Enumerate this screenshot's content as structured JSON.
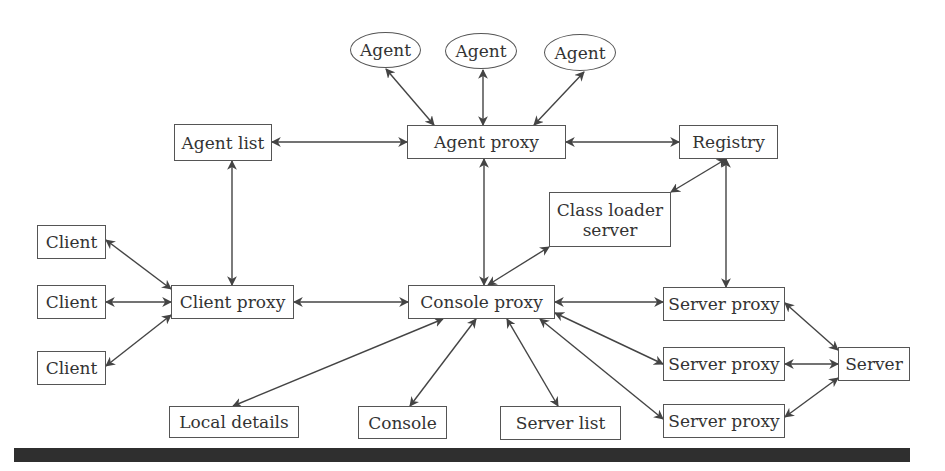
{
  "diagram": {
    "nodes": [
      {
        "id": "agent1",
        "label": "Agent",
        "shape": "ellipse",
        "x": 350,
        "y": 32,
        "w": 71,
        "h": 36
      },
      {
        "id": "agent2",
        "label": "Agent",
        "shape": "ellipse",
        "x": 445,
        "y": 33,
        "w": 72,
        "h": 36
      },
      {
        "id": "agent3",
        "label": "Agent",
        "shape": "ellipse",
        "x": 544,
        "y": 34,
        "w": 72,
        "h": 37
      },
      {
        "id": "agent-list",
        "label": "Agent list",
        "shape": "rect",
        "x": 174,
        "y": 124,
        "w": 98,
        "h": 37
      },
      {
        "id": "agent-proxy",
        "label": "Agent proxy",
        "shape": "rect",
        "x": 407,
        "y": 125,
        "w": 159,
        "h": 34
      },
      {
        "id": "registry",
        "label": "Registry",
        "shape": "rect",
        "x": 679,
        "y": 125,
        "w": 99,
        "h": 34
      },
      {
        "id": "class-loader-server",
        "label": "Class loader\nserver",
        "shape": "rect",
        "x": 549,
        "y": 192,
        "w": 122,
        "h": 55
      },
      {
        "id": "client1",
        "label": "Client",
        "shape": "rect",
        "x": 37,
        "y": 225,
        "w": 69,
        "h": 34
      },
      {
        "id": "client2",
        "label": "Client",
        "shape": "rect",
        "x": 37,
        "y": 285,
        "w": 69,
        "h": 34
      },
      {
        "id": "client3",
        "label": "Client",
        "shape": "rect",
        "x": 37,
        "y": 351,
        "w": 69,
        "h": 34
      },
      {
        "id": "client-proxy",
        "label": "Client proxy",
        "shape": "rect",
        "x": 171,
        "y": 285,
        "w": 123,
        "h": 34
      },
      {
        "id": "console-proxy",
        "label": "Console proxy",
        "shape": "rect",
        "x": 408,
        "y": 285,
        "w": 147,
        "h": 34
      },
      {
        "id": "server-proxy1",
        "label": "Server proxy",
        "shape": "rect",
        "x": 663,
        "y": 287,
        "w": 122,
        "h": 34
      },
      {
        "id": "server-proxy2",
        "label": "Server proxy",
        "shape": "rect",
        "x": 663,
        "y": 347,
        "w": 122,
        "h": 34
      },
      {
        "id": "server-proxy3",
        "label": "Server proxy",
        "shape": "rect",
        "x": 663,
        "y": 404,
        "w": 122,
        "h": 34
      },
      {
        "id": "server",
        "label": "Server",
        "shape": "rect",
        "x": 838,
        "y": 347,
        "w": 72,
        "h": 34
      },
      {
        "id": "local-details",
        "label": "Local details",
        "shape": "rect",
        "x": 169,
        "y": 406,
        "w": 130,
        "h": 32
      },
      {
        "id": "console",
        "label": "Console",
        "shape": "rect",
        "x": 358,
        "y": 406,
        "w": 89,
        "h": 33
      },
      {
        "id": "server-list",
        "label": "Server list",
        "shape": "rect",
        "x": 500,
        "y": 406,
        "w": 121,
        "h": 34
      }
    ],
    "edges": [
      {
        "from": "agent1",
        "to": "agent-proxy",
        "x1": 386,
        "y1": 69,
        "x2": 434,
        "y2": 125,
        "direction": "both"
      },
      {
        "from": "agent2",
        "to": "agent-proxy",
        "x1": 483,
        "y1": 70,
        "x2": 483,
        "y2": 125,
        "direction": "both"
      },
      {
        "from": "agent3",
        "to": "agent-proxy",
        "x1": 584,
        "y1": 72,
        "x2": 534,
        "y2": 125,
        "direction": "both"
      },
      {
        "from": "agent-list",
        "to": "agent-proxy",
        "x1": 272,
        "y1": 142,
        "x2": 407,
        "y2": 142,
        "direction": "both"
      },
      {
        "from": "agent-proxy",
        "to": "registry",
        "x1": 566,
        "y1": 142,
        "x2": 679,
        "y2": 142,
        "direction": "both"
      },
      {
        "from": "agent-list",
        "to": "client-proxy",
        "x1": 232,
        "y1": 161,
        "x2": 232,
        "y2": 285,
        "direction": "both"
      },
      {
        "from": "agent-proxy",
        "to": "console-proxy",
        "x1": 484,
        "y1": 159,
        "x2": 484,
        "y2": 285,
        "direction": "both"
      },
      {
        "from": "registry",
        "to": "class-loader-server",
        "x1": 726,
        "y1": 159,
        "x2": 671,
        "y2": 192,
        "direction": "both"
      },
      {
        "from": "registry",
        "to": "server-proxy1",
        "x1": 726,
        "y1": 159,
        "x2": 726,
        "y2": 287,
        "direction": "both"
      },
      {
        "from": "class-loader-server",
        "to": "console-proxy",
        "x1": 549,
        "y1": 247,
        "x2": 488,
        "y2": 285,
        "direction": "both"
      },
      {
        "from": "client1",
        "to": "client-proxy",
        "x1": 106,
        "y1": 240,
        "x2": 171,
        "y2": 289,
        "direction": "both"
      },
      {
        "from": "client2",
        "to": "client-proxy",
        "x1": 106,
        "y1": 302,
        "x2": 171,
        "y2": 302,
        "direction": "both"
      },
      {
        "from": "client3",
        "to": "client-proxy",
        "x1": 106,
        "y1": 366,
        "x2": 171,
        "y2": 315,
        "direction": "both"
      },
      {
        "from": "client-proxy",
        "to": "console-proxy",
        "x1": 294,
        "y1": 302,
        "x2": 408,
        "y2": 302,
        "direction": "both"
      },
      {
        "from": "console-proxy",
        "to": "server-proxy1",
        "x1": 555,
        "y1": 302,
        "x2": 663,
        "y2": 302,
        "direction": "both"
      },
      {
        "from": "console-proxy",
        "to": "server-proxy2",
        "x1": 555,
        "y1": 313,
        "x2": 663,
        "y2": 364,
        "direction": "both"
      },
      {
        "from": "console-proxy",
        "to": "server-proxy3",
        "x1": 540,
        "y1": 319,
        "x2": 663,
        "y2": 419,
        "direction": "both"
      },
      {
        "from": "console-proxy",
        "to": "local-details",
        "x1": 443,
        "y1": 319,
        "x2": 233,
        "y2": 406,
        "direction": "both"
      },
      {
        "from": "console-proxy",
        "to": "console",
        "x1": 476,
        "y1": 319,
        "x2": 410,
        "y2": 406,
        "direction": "both"
      },
      {
        "from": "console-proxy",
        "to": "server-list",
        "x1": 507,
        "y1": 319,
        "x2": 558,
        "y2": 406,
        "direction": "both"
      },
      {
        "from": "server-proxy1",
        "to": "server",
        "x1": 785,
        "y1": 303,
        "x2": 838,
        "y2": 350,
        "direction": "both"
      },
      {
        "from": "server-proxy2",
        "to": "server",
        "x1": 785,
        "y1": 364,
        "x2": 838,
        "y2": 364,
        "direction": "both"
      },
      {
        "from": "server-proxy3",
        "to": "server",
        "x1": 785,
        "y1": 417,
        "x2": 838,
        "y2": 378,
        "direction": "both"
      }
    ],
    "colors": {
      "stroke": "#444444",
      "text": "#333333",
      "box_border": "#555555",
      "footer_bar": "#2f2f2f",
      "background": "#ffffff"
    }
  }
}
